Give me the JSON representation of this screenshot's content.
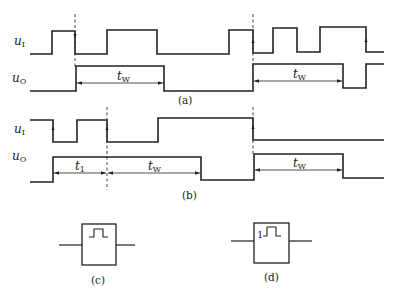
{
  "figure": {
    "panels": [
      {
        "id": "a",
        "caption": "(a)",
        "signals": [
          {
            "name": "u",
            "sub": "I",
            "label_y": 45
          },
          {
            "name": "u",
            "sub": "O",
            "label_y": 82
          }
        ],
        "dimensions": [
          {
            "name": "t",
            "sub": "W"
          },
          {
            "name": "t",
            "sub": "W"
          }
        ]
      },
      {
        "id": "b",
        "caption": "(b)",
        "signals": [
          {
            "name": "u",
            "sub": "I",
            "label_y": 133
          },
          {
            "name": "u",
            "sub": "O",
            "label_y": 160
          }
        ],
        "dimensions": [
          {
            "name": "t",
            "sub": "1"
          },
          {
            "name": "t",
            "sub": "W"
          },
          {
            "name": "t",
            "sub": "W"
          }
        ]
      },
      {
        "id": "c",
        "caption": "(c)",
        "symbol": "non-retriggerable monostable (pulse glyph)"
      },
      {
        "id": "d",
        "caption": "(d)",
        "symbol": "retriggerable monostable",
        "qualifier": "1"
      }
    ]
  }
}
